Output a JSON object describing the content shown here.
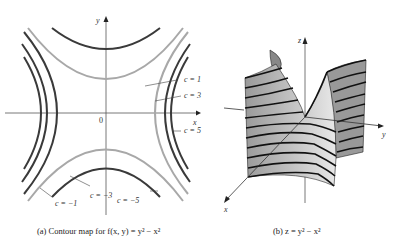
{
  "panel_a": {
    "caption": "(a) Contour map for f(x, y) = y² − x²",
    "axis_x": "x",
    "axis_y": "y",
    "origin": "0",
    "levels": [
      {
        "label": "c = 1",
        "value": 1
      },
      {
        "label": "c = 3",
        "value": 3
      },
      {
        "label": "c = 5",
        "value": 5
      },
      {
        "label": "c = −1",
        "value": -1
      },
      {
        "label": "c = −3",
        "value": -3
      },
      {
        "label": "c = −5",
        "value": -5
      }
    ],
    "colors": {
      "dark": "#3a3a3a",
      "light": "#a8a8a8"
    }
  },
  "panel_b": {
    "caption": "(b) z = y² − x²",
    "axis_x": "x",
    "axis_y": "y",
    "axis_z": "z"
  }
}
